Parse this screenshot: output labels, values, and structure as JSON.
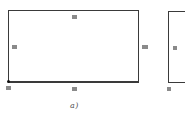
{
  "diagram": {
    "figure_a": {
      "caption": "a)",
      "rectangle": {
        "x": 8,
        "y": 10,
        "width": 131,
        "height": 72
      },
      "labels": {
        "top": "▦",
        "bottom": "▦",
        "left": "▦",
        "right": "▦",
        "corner_bottom_left": "▦"
      },
      "anchor_point": {
        "x": 8,
        "y": 82
      }
    },
    "figure_b_partial": {
      "rectangle": {
        "x": 168,
        "y": 11,
        "height": 72
      },
      "labels": {
        "left_outside": "▦",
        "left_inside": "▦",
        "corner_bottom_left": "▦"
      }
    },
    "colors": {
      "line": "#3a3a3a",
      "label": "#8a8a8a",
      "background": "#ffffff"
    }
  }
}
